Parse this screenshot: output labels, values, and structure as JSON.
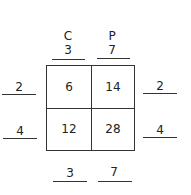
{
  "columns": {
    "headers": [
      "C",
      "P"
    ],
    "top_values": [
      "3",
      "7"
    ],
    "bottom_values": [
      "3",
      "7"
    ]
  },
  "rows": {
    "left_values": [
      "2",
      "4"
    ],
    "right_values": [
      "2",
      "4"
    ]
  },
  "cells": [
    [
      "6",
      "14"
    ],
    [
      "12",
      "28"
    ]
  ]
}
